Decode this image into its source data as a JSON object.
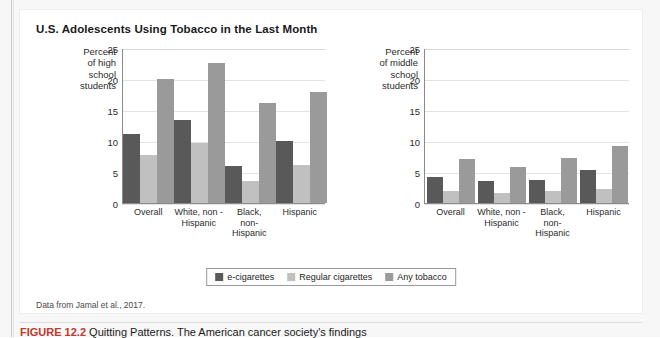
{
  "figure": {
    "title": "U.S. Adolescents Using Tobacco in the Last Month",
    "source": "Data from Jamal et al., 2017.",
    "caption_label": "FIGURE 12.2",
    "caption_text": " Quitting Patterns. The American cancer society's findings"
  },
  "legend": {
    "position": "bottom-center",
    "items": [
      {
        "label": "e-cigarettes",
        "color": "#595959"
      },
      {
        "label": "Regular cigarettes",
        "color": "#c0c0c0"
      },
      {
        "label": "Any tobacco",
        "color": "#9a9a9a"
      }
    ]
  },
  "chart_data": [
    {
      "type": "bar",
      "title": "U.S. Adolescents Using Tobacco in the Last Month",
      "ylabel": "Percent of high school students",
      "xlabel": "",
      "ylim": [
        0,
        25
      ],
      "yticks": [
        0,
        5,
        10,
        15,
        20,
        25
      ],
      "grid": true,
      "categories": [
        "Overall",
        "White, non -Hispanic",
        "Black, non-Hispanic",
        "Hispanic"
      ],
      "series": [
        {
          "name": "e-cigarettes",
          "color": "#595959",
          "values": [
            11.2,
            13.5,
            6.0,
            10.1
          ]
        },
        {
          "name": "Regular cigarettes",
          "color": "#c0c0c0",
          "values": [
            7.8,
            9.8,
            3.6,
            6.1
          ]
        },
        {
          "name": "Any tobacco",
          "color": "#9a9a9a",
          "values": [
            20.1,
            22.8,
            16.2,
            18.0
          ]
        }
      ]
    },
    {
      "type": "bar",
      "title": "",
      "ylabel": "Percent of middle school students",
      "xlabel": "",
      "ylim": [
        0,
        25
      ],
      "yticks": [
        0,
        5,
        10,
        15,
        20,
        25
      ],
      "grid": true,
      "categories": [
        "Overall",
        "White, non -Hispanic",
        "Black, non-Hispanic",
        "Hispanic"
      ],
      "series": [
        {
          "name": "e-cigarettes",
          "color": "#595959",
          "values": [
            4.3,
            3.6,
            3.8,
            5.4
          ]
        },
        {
          "name": "Regular cigarettes",
          "color": "#c0c0c0",
          "values": [
            2.0,
            1.7,
            1.9,
            2.3
          ]
        },
        {
          "name": "Any tobacco",
          "color": "#9a9a9a",
          "values": [
            7.1,
            5.8,
            7.3,
            9.3
          ]
        }
      ]
    }
  ],
  "panels": [
    {
      "axis_title_lines": [
        "Percent",
        "of high",
        "school",
        "students"
      ],
      "xlabel_lines": [
        [
          "Overall"
        ],
        [
          "White, non -",
          "Hispanic"
        ],
        [
          "Black,",
          "non-Hispanic"
        ],
        [
          "Hispanic"
        ]
      ]
    },
    {
      "axis_title_lines": [
        "Percent",
        "of middle",
        "school",
        "students"
      ],
      "xlabel_lines": [
        [
          "Overall"
        ],
        [
          "White, non -",
          "Hispanic"
        ],
        [
          "Black,",
          "non-Hispanic"
        ],
        [
          "Hispanic"
        ]
      ]
    }
  ]
}
